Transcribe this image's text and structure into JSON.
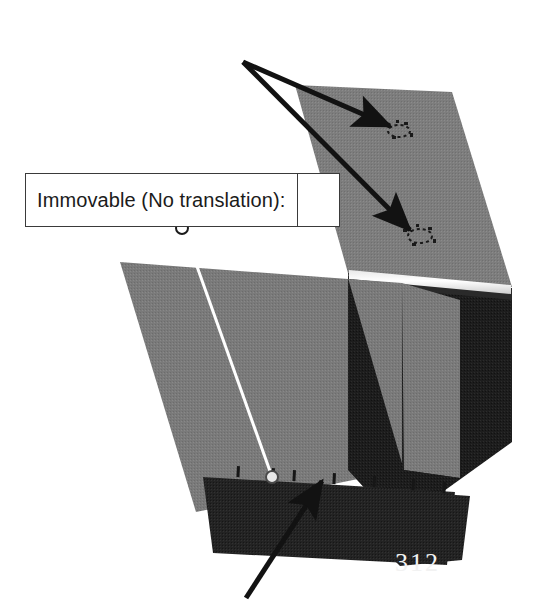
{
  "figure": {
    "kind": "fea-boundary-condition-diagram",
    "background_color": "#ffffff",
    "watermark_text": "312"
  },
  "callout": {
    "label": "Immovable (No translation):",
    "value": "",
    "border_color": "#3a3a3a",
    "fill_color": "#ffffff",
    "leader_color": "#ffffff",
    "anchor_symbol": "circle"
  },
  "annotations": {
    "top_arrows_color": "#121212",
    "bottom_arrow_color": "#121212",
    "arrow_origin_label": "shared-arrow-origin",
    "targets": [
      "bolt-hole-restraint-upper",
      "bolt-hole-restraint-lower"
    ],
    "bottom_target": "bottom-edge-restraint"
  },
  "model": {
    "top_panel_color": "#7d7d7d",
    "left_panel_color": "#7a7a7a",
    "dark_face_color": "#1d1d1d",
    "bottom_band_color": "#232323",
    "highlight_color": "#fdfdfd",
    "edge_shadow_color": "#3d3d3d",
    "restraint_tick_color": "#161616",
    "parts": [
      "top-flange-panel",
      "left-web-panel",
      "right-dark-face",
      "bottom-base-band",
      "edge-highlight-strip"
    ]
  }
}
